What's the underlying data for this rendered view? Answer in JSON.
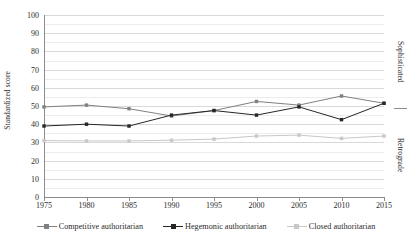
{
  "chart_data": {
    "type": "line",
    "title": "",
    "xlabel": "",
    "ylabel": "Standardized score",
    "x": [
      1975,
      1980,
      1985,
      1990,
      1995,
      2000,
      2005,
      2010,
      2015
    ],
    "xtick_labels": [
      "1975",
      "1980",
      "1985",
      "1990",
      "1995",
      "2000",
      "2005",
      "2010",
      "2015"
    ],
    "ytick_labels": [
      "0",
      "10",
      "20",
      "30",
      "40",
      "50",
      "60",
      "70",
      "80",
      "90",
      "100"
    ],
    "ylim": [
      0,
      100
    ],
    "ytick_step": 10,
    "yminor_step": 5,
    "grid": true,
    "legend_position": "bottom",
    "series": [
      {
        "name": "Competitive authoritarian",
        "color": "#808080",
        "marker": "square",
        "values": [
          49.5,
          50.5,
          48.5,
          44.5,
          47.5,
          52.5,
          50.5,
          55.5,
          51.5
        ]
      },
      {
        "name": "Hegemonic authoritarian",
        "color": "#262626",
        "marker": "square",
        "values": [
          39,
          40,
          39,
          45,
          47.5,
          45,
          49.5,
          42.5,
          51.5
        ]
      },
      {
        "name": "Closed authoritarian",
        "color": "#c8c8c8",
        "marker": "square",
        "values": [
          31,
          30.8,
          30.8,
          31.2,
          31.8,
          33.5,
          34,
          32.2,
          33.5
        ]
      }
    ],
    "annotations": [
      {
        "text": "Sophisticated",
        "position": "right-top"
      },
      {
        "text": "Retrograde",
        "position": "right-bottom"
      }
    ]
  },
  "axis": {
    "y_title": "Standardized score"
  },
  "side_labels": {
    "top": "Sophisticated",
    "bottom": "Retrograde"
  },
  "legend": {
    "items": [
      {
        "label": "Competitive authoritarian"
      },
      {
        "label": "Hegemonic authoritarian"
      },
      {
        "label": "Closed authoritarian"
      }
    ]
  }
}
